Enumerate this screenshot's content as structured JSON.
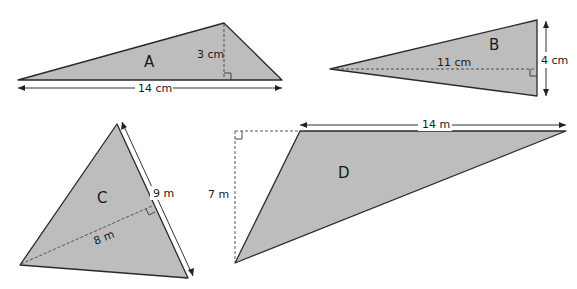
{
  "triangles": [
    {
      "id": "A",
      "label": "A",
      "base": "14 cm",
      "height": "3 cm"
    },
    {
      "id": "B",
      "label": "B",
      "base": "4 cm",
      "height": "11 cm"
    },
    {
      "id": "C",
      "label": "C",
      "base": "9 m",
      "height": "8 m"
    },
    {
      "id": "D",
      "label": "D",
      "base": "14 m",
      "height": "7 m"
    }
  ],
  "colors": {
    "fill": "#bdbdbd",
    "stroke": "#2a2a2a",
    "background": "#ffffff"
  }
}
